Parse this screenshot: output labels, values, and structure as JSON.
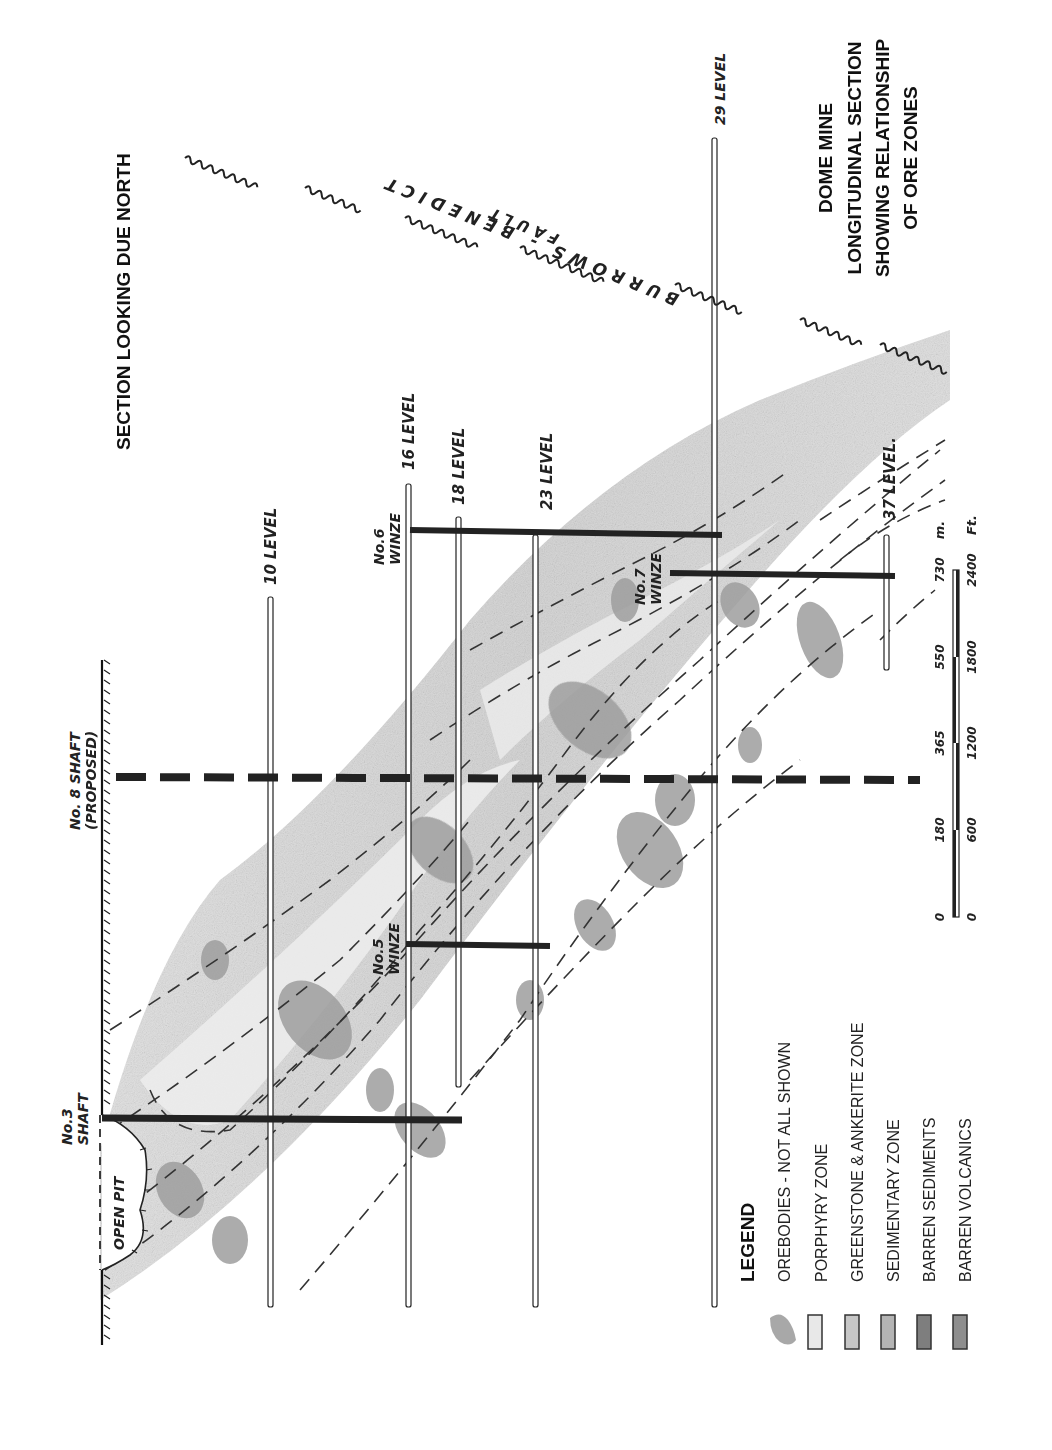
{
  "orientation": "rotated 90deg clockwise (text reads bottom-to-top)",
  "header": {
    "section_label": "SECTION LOOKING DUE NORTH",
    "title_lines": [
      "DOME MINE",
      "LONGITUDINAL SECTION",
      "SHOWING RELATIONSHIP",
      "OF ORE ZONES"
    ]
  },
  "shafts": {
    "no3": {
      "label_line1": "No.3",
      "label_line2": "SHAFT"
    },
    "no8": {
      "label_line1": "No. 8 SHAFT",
      "label_line2": "(PROPOSED)"
    },
    "open_pit": "OPEN PIT"
  },
  "winzes": {
    "no5": {
      "label_line1": "No.5",
      "label_line2": "WINZE"
    },
    "no6": {
      "label_line1": "No.6",
      "label_line2": "WINZE"
    },
    "no7": {
      "label_line1": "No.7",
      "label_line2": "WINZE"
    }
  },
  "levels": [
    "10 LEVEL",
    "16 LEVEL",
    "18 LEVEL",
    "23 LEVEL",
    "29 LEVEL",
    "37 LEVEL."
  ],
  "fault": {
    "label_line1": "BURROWS - BENEDICT",
    "label_line2": "FAULT"
  },
  "scale_bar": {
    "metres": [
      "0",
      "180",
      "365",
      "550",
      "730"
    ],
    "metres_unit": "m.",
    "feet": [
      "0",
      "600",
      "1200",
      "1800",
      "2400"
    ],
    "feet_unit": "Ft."
  },
  "legend": {
    "title": "LEGEND",
    "items": [
      {
        "label": "OREBODIES - NOT ALL SHOWN",
        "swatch": "#9a9a9a",
        "shape": "blob"
      },
      {
        "label": "PORPHYRY ZONE",
        "swatch": "#e8e8e8",
        "shape": "box"
      },
      {
        "label": "GREENSTONE & ANKERITE ZONE",
        "swatch": "#c4c4c4",
        "shape": "box"
      },
      {
        "label": "SEDIMENTARY ZONE",
        "swatch": "#b0b0b0",
        "shape": "box"
      },
      {
        "label": "BARREN SEDIMENTS",
        "swatch": "#7e7e7e",
        "shape": "box"
      },
      {
        "label": "BARREN VOLCANICS",
        "swatch": "#8e8e8e",
        "shape": "box"
      }
    ]
  },
  "colors": {
    "ink": "#1a1a1a",
    "zone_light": "#e2e2e2",
    "zone_mid": "#c6c6c6",
    "ore": "#9c9c9c"
  }
}
